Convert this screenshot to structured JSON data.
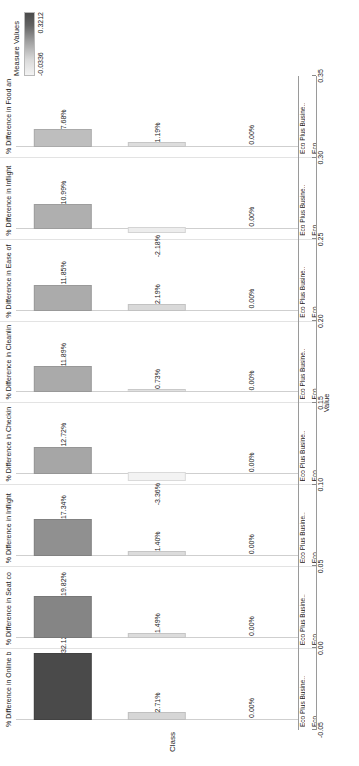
{
  "legend": {
    "title": "Measure Values",
    "min_label": "-0.0336",
    "max_label": "0.3212",
    "gradient_low": "#f3f3f3",
    "gradient_high": "#4a4a4a"
  },
  "axes": {
    "category_axis_title": "Class",
    "value_axis_title": "Value",
    "value_ticks": [
      "0.35",
      "0.30",
      "0.25",
      "0.20",
      "0.15",
      "0.10",
      "0.05",
      "0.00",
      "-0.05"
    ],
    "value_min": -0.05,
    "value_max": 0.35
  },
  "subcategories": [
    "Eco",
    "Eco Plus Busine.."
  ],
  "chart_data": {
    "type": "bar",
    "title": "",
    "xlabel": "Value",
    "ylabel": "Class",
    "ylim": [
      -0.05,
      0.35
    ],
    "grid": true,
    "legend_position": "top-right",
    "orientation": "horizontal",
    "facets": [
      {
        "label": "% Difference in Online b",
        "categories": [
          "Eco",
          "Eco Plus Busine.."
        ],
        "values": [
          0.0,
          0.3212
        ],
        "value_labels": [
          "0.00%",
          "32.12%"
        ],
        "extra_value": 0.0271,
        "extra_value_label": "2.71%"
      },
      {
        "label": "% Difference in Seat co",
        "categories": [
          "Eco",
          "Eco Plus Busine.."
        ],
        "values": [
          0.0,
          0.1982
        ],
        "value_labels": [
          "0.00%",
          "19.82%"
        ],
        "extra_value": 0.0149,
        "extra_value_label": "1.49%"
      },
      {
        "label": "% Difference in Inflight",
        "categories": [
          "Eco",
          "Eco Plus Busine.."
        ],
        "values": [
          0.0,
          0.1734
        ],
        "value_labels": [
          "0.00%",
          "17.34%"
        ],
        "extra_value": 0.014,
        "extra_value_label": "1.40%"
      },
      {
        "label": "% Difference in Checkin",
        "categories": [
          "Eco",
          "Eco Plus Busine.."
        ],
        "values": [
          0.0,
          0.1272
        ],
        "value_labels": [
          "0.00%",
          "12.72%"
        ],
        "extra_value": -0.0336,
        "extra_value_label": "-3.36%"
      },
      {
        "label": "% Difference in Cleanlin",
        "categories": [
          "Eco",
          "Eco Plus Busine.."
        ],
        "values": [
          0.0,
          0.1189
        ],
        "value_labels": [
          "0.00%",
          "11.89%"
        ],
        "extra_value": 0.0073,
        "extra_value_label": "0.73%"
      },
      {
        "label": "% Difference in Ease of",
        "categories": [
          "Eco",
          "Eco Plus Busine.."
        ],
        "values": [
          0.0,
          0.1185
        ],
        "value_labels": [
          "0.00%",
          "11.85%"
        ],
        "extra_value": 0.0219,
        "extra_value_label": "2.19%"
      },
      {
        "label": "% Difference in Inflight",
        "categories": [
          "Eco",
          "Eco Plus Busine.."
        ],
        "values": [
          0.0,
          0.1099
        ],
        "value_labels": [
          "0.00%",
          "10.99%"
        ],
        "extra_value": -0.0218,
        "extra_value_label": "-2.18%"
      },
      {
        "label": "% Difference in Food an",
        "categories": [
          "Eco",
          "Eco Plus Busine.."
        ],
        "values": [
          0.0,
          0.0768
        ],
        "value_labels": [
          "0.00%",
          "7.68%"
        ],
        "extra_value": 0.0119,
        "extra_value_label": "1.19%"
      }
    ]
  }
}
